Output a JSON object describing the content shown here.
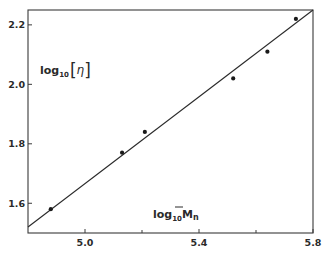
{
  "chart_data": {
    "type": "scatter",
    "title": "",
    "xlabel": "log10 Mn",
    "xlabel_parts": {
      "base": "log",
      "sub": "10",
      "main": "M",
      "overbar": true,
      "main_sub": "n"
    },
    "ylabel": "log10 [η]",
    "ylabel_parts": {
      "base": "log",
      "sub": "10",
      "bracket_open": "[",
      "symbol": "η",
      "bracket_close": "]"
    },
    "xlim": [
      4.8,
      5.8
    ],
    "ylim": [
      1.5,
      2.25
    ],
    "x_major_ticks": [
      5.0,
      5.4,
      5.8
    ],
    "x_minor_ticks": [
      5.2,
      5.6
    ],
    "x_tick_labels": [
      "5.0",
      "5.4",
      "5.8"
    ],
    "y_ticks": [
      1.6,
      1.8,
      2.0,
      2.2
    ],
    "y_tick_labels": [
      "1.6",
      "1.8",
      "2.0",
      "2.2"
    ],
    "grid": false,
    "legend": "none",
    "series": [
      {
        "name": "data",
        "marker": "dot",
        "x": [
          4.88,
          5.13,
          5.21,
          5.52,
          5.64,
          5.74
        ],
        "y": [
          1.58,
          1.77,
          1.84,
          2.02,
          2.11,
          2.22
        ]
      }
    ],
    "fit_line": {
      "x": [
        4.8,
        5.8
      ],
      "y": [
        1.52,
        2.25
      ]
    }
  },
  "colors": {
    "ink": "#2a2a2a",
    "background": "#ffffff"
  }
}
